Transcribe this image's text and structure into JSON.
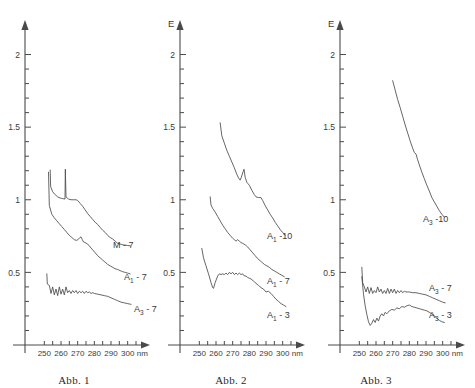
{
  "page": {
    "background": "#ffffff",
    "ink": "#4a4a4a",
    "text_color": "#3a3a3a"
  },
  "figures": [
    {
      "id": "fig1",
      "caption": "Abb. 1",
      "yaxis_label": "",
      "xaxis_unit": "nm",
      "yticks": [
        "0.5",
        "1.0",
        "1.5",
        "2.0"
      ],
      "xticks": [
        "250",
        "260",
        "270",
        "280",
        "290",
        "300"
      ],
      "curve_labels": [
        "M - 7",
        "A₁ - 7",
        "A₃ - 7"
      ]
    },
    {
      "id": "fig2",
      "caption": "Abb. 2",
      "yaxis_label": "E",
      "xaxis_unit": "nm",
      "yticks": [
        "0.5",
        "1.0",
        "1.5",
        "2.0"
      ],
      "xticks": [
        "250",
        "260",
        "270",
        "280",
        "290",
        "300"
      ],
      "curve_labels": [
        "A₁ -10",
        "A₁ - 7",
        "A₁ - 3"
      ]
    },
    {
      "id": "fig3",
      "caption": "Abb. 3",
      "yaxis_label": "E",
      "xaxis_unit": "nm",
      "yticks": [
        "0.5",
        "1.0",
        "1.5",
        "2.0"
      ],
      "xticks": [
        "250",
        "260",
        "270",
        "280",
        "290",
        "300"
      ],
      "curve_labels": [
        "A₃ -10",
        "A₃ - 7",
        "A₃ - 3"
      ]
    }
  ],
  "chart_data": [
    {
      "type": "line",
      "title": "Abb. 1",
      "xlabel": "nm",
      "ylabel": "E",
      "xlim": [
        245,
        308
      ],
      "ylim": [
        0,
        2.1
      ],
      "xticks": [
        250,
        260,
        270,
        280,
        290,
        300
      ],
      "yticks": [
        0.5,
        1.0,
        1.5,
        2.0
      ],
      "grid": false,
      "legend": "inline-right-of-curve",
      "series": [
        {
          "name": "M - 7",
          "x": [
            253.5,
            253.8,
            255,
            256.5,
            258,
            259.5,
            261,
            262.4,
            262.6,
            263,
            264.5,
            266,
            267.5,
            269,
            270,
            271.5,
            273,
            274.5,
            276,
            277.5,
            279,
            280.5,
            282,
            283.5,
            285,
            286.5,
            288,
            289.5,
            291,
            292.5,
            294,
            295.5,
            297,
            298.5,
            300,
            301.5
          ],
          "y": [
            1.205,
            1.09,
            1.055,
            1.035,
            1.02,
            1.012,
            1.008,
            1.005,
            1.21,
            1.02,
            1.005,
            1.0,
            1.0,
            1.0,
            0.995,
            0.975,
            0.955,
            0.93,
            0.905,
            0.885,
            0.865,
            0.845,
            0.83,
            0.81,
            0.79,
            0.775,
            0.755,
            0.74,
            0.73,
            0.715,
            0.7,
            0.695,
            0.69,
            0.688,
            0.685,
            0.683
          ]
        },
        {
          "name": "A₁ - 7",
          "x": [
            252.5,
            253,
            254.5,
            256,
            257.5,
            259,
            260.5,
            262,
            263.5,
            265,
            266.5,
            268,
            269.5,
            271,
            272,
            272.8,
            273.5,
            274.5,
            276,
            277.5,
            279,
            280.5,
            282,
            283.5,
            285,
            286.5,
            288,
            289.5,
            291,
            292.5,
            294,
            295.5,
            297,
            298.5,
            300,
            301.5
          ],
          "y": [
            1.19,
            0.96,
            0.9,
            0.875,
            0.855,
            0.835,
            0.815,
            0.795,
            0.775,
            0.755,
            0.74,
            0.725,
            0.72,
            0.735,
            0.745,
            0.725,
            0.71,
            0.705,
            0.695,
            0.675,
            0.655,
            0.635,
            0.615,
            0.6,
            0.585,
            0.57,
            0.555,
            0.545,
            0.535,
            0.525,
            0.52,
            0.512,
            0.505,
            0.5,
            0.495,
            0.49
          ]
        },
        {
          "name": "A₃ - 7",
          "x": [
            251.5,
            251.8,
            253,
            254,
            255,
            256,
            257,
            258,
            259,
            260,
            261,
            262,
            263,
            264,
            265,
            266,
            267,
            268,
            269,
            270,
            271,
            272,
            273,
            274,
            275,
            276,
            277,
            278,
            279,
            280,
            282,
            284,
            286,
            288,
            290,
            292,
            294,
            296,
            298,
            300,
            302
          ],
          "y": [
            0.49,
            0.42,
            0.41,
            0.355,
            0.4,
            0.345,
            0.385,
            0.34,
            0.4,
            0.35,
            0.385,
            0.345,
            0.4,
            0.36,
            0.375,
            0.355,
            0.375,
            0.36,
            0.375,
            0.355,
            0.37,
            0.36,
            0.37,
            0.355,
            0.37,
            0.36,
            0.365,
            0.355,
            0.36,
            0.355,
            0.35,
            0.345,
            0.34,
            0.335,
            0.325,
            0.315,
            0.305,
            0.295,
            0.29,
            0.285,
            0.28
          ]
        }
      ]
    },
    {
      "type": "line",
      "title": "Abb. 2",
      "xlabel": "nm",
      "ylabel": "E",
      "xlim": [
        245,
        308
      ],
      "ylim": [
        0,
        2.1
      ],
      "xticks": [
        250,
        260,
        270,
        280,
        290,
        300
      ],
      "yticks": [
        0.5,
        1.0,
        1.5,
        2.0
      ],
      "grid": false,
      "legend": "inline-right-of-curve",
      "series": [
        {
          "name": "A₁ -10",
          "x": [
            262.5,
            263.5,
            265,
            266.5,
            268,
            269.5,
            271,
            272.5,
            273.5,
            274.5,
            275.2,
            276,
            276.8,
            277.5,
            278.5,
            280,
            281.5,
            283,
            284,
            285.5,
            287,
            288,
            289.5,
            291,
            292.5,
            294,
            295.5,
            297,
            298.5,
            300,
            301.5
          ],
          "y": [
            1.53,
            1.44,
            1.39,
            1.34,
            1.3,
            1.26,
            1.22,
            1.175,
            1.15,
            1.135,
            1.155,
            1.185,
            1.21,
            1.155,
            1.12,
            1.1,
            1.065,
            1.035,
            1.02,
            1.015,
            1.015,
            0.995,
            0.96,
            0.93,
            0.9,
            0.875,
            0.845,
            0.82,
            0.795,
            0.775,
            0.755
          ]
        },
        {
          "name": "A₁ - 7",
          "x": [
            256.5,
            257,
            258,
            259.5,
            261,
            262.5,
            264,
            265.5,
            267,
            268.5,
            270,
            271,
            272,
            273,
            274,
            275,
            276,
            277.5,
            279,
            280.5,
            282,
            283.5,
            285,
            286.5,
            288,
            289,
            290.5,
            292,
            293.5,
            295,
            296.5,
            298,
            299.5,
            301
          ],
          "y": [
            1.02,
            0.965,
            0.94,
            0.915,
            0.885,
            0.855,
            0.825,
            0.8,
            0.775,
            0.755,
            0.735,
            0.725,
            0.715,
            0.725,
            0.715,
            0.705,
            0.7,
            0.69,
            0.675,
            0.655,
            0.635,
            0.615,
            0.595,
            0.58,
            0.565,
            0.555,
            0.545,
            0.535,
            0.52,
            0.51,
            0.5,
            0.49,
            0.48,
            0.47
          ]
        },
        {
          "name": "A₁ - 3",
          "x": [
            251.5,
            252.5,
            254,
            255.5,
            257,
            258,
            258.5,
            259.5,
            261,
            262,
            263,
            264,
            265,
            266,
            267,
            268,
            269,
            270,
            271,
            272,
            273,
            274,
            275,
            276,
            277,
            278,
            279,
            280,
            281,
            282.5,
            284,
            285.5,
            287,
            288.5,
            290,
            291.5,
            293,
            294.5,
            296,
            297.5,
            299,
            300.5,
            302
          ],
          "y": [
            0.665,
            0.6,
            0.545,
            0.49,
            0.43,
            0.395,
            0.39,
            0.43,
            0.475,
            0.49,
            0.485,
            0.49,
            0.485,
            0.495,
            0.485,
            0.5,
            0.49,
            0.5,
            0.485,
            0.495,
            0.485,
            0.495,
            0.485,
            0.49,
            0.475,
            0.475,
            0.465,
            0.46,
            0.455,
            0.44,
            0.425,
            0.41,
            0.395,
            0.385,
            0.365,
            0.37,
            0.355,
            0.335,
            0.315,
            0.3,
            0.285,
            0.275,
            0.265
          ]
        }
      ]
    },
    {
      "type": "line",
      "title": "Abb. 3",
      "xlabel": "nm",
      "ylabel": "E",
      "xlim": [
        245,
        308
      ],
      "ylim": [
        0,
        2.1
      ],
      "xticks": [
        250,
        260,
        270,
        280,
        290,
        300
      ],
      "yticks": [
        0.5,
        1.0,
        1.5,
        2.0
      ],
      "grid": false,
      "legend": "inline-right-of-curve",
      "series": [
        {
          "name": "A₃ -10",
          "x": [
            270,
            271.5,
            273,
            274.5,
            276,
            277.5,
            279,
            280.5,
            282,
            283,
            284,
            285,
            286,
            287.5,
            289,
            290.5,
            292,
            293.5,
            295,
            296.5,
            298,
            299.5,
            301
          ],
          "y": [
            1.82,
            1.755,
            1.69,
            1.635,
            1.575,
            1.515,
            1.46,
            1.405,
            1.355,
            1.325,
            1.315,
            1.275,
            1.24,
            1.19,
            1.145,
            1.1,
            1.06,
            1.015,
            0.985,
            0.955,
            0.925,
            0.9,
            0.88
          ]
        },
        {
          "name": "A₃ - 7",
          "x": [
            251.5,
            252,
            253,
            254,
            255,
            256,
            257,
            258,
            259,
            260,
            261,
            262,
            263,
            264,
            265,
            266,
            267,
            268,
            269,
            270,
            271,
            272,
            273,
            274,
            275,
            276,
            277,
            278,
            280,
            282,
            284,
            286,
            288,
            290,
            292,
            294,
            296,
            298,
            300,
            301.5
          ],
          "y": [
            0.535,
            0.43,
            0.4,
            0.365,
            0.4,
            0.355,
            0.395,
            0.355,
            0.375,
            0.36,
            0.4,
            0.365,
            0.385,
            0.355,
            0.375,
            0.355,
            0.39,
            0.355,
            0.385,
            0.36,
            0.385,
            0.355,
            0.375,
            0.36,
            0.375,
            0.36,
            0.37,
            0.365,
            0.365,
            0.36,
            0.36,
            0.355,
            0.35,
            0.345,
            0.335,
            0.325,
            0.315,
            0.305,
            0.295,
            0.29
          ]
        },
        {
          "name": "A₃ - 3",
          "x": [
            251.5,
            252.5,
            253.5,
            254.5,
            255.5,
            256.5,
            257.5,
            258.5,
            259.5,
            260.5,
            261.5,
            262.5,
            263.5,
            264.5,
            265.5,
            266.5,
            268,
            269.5,
            271,
            272.5,
            274,
            275.5,
            277,
            278.5,
            280,
            281.5,
            283,
            284.5,
            286,
            287.5,
            289,
            290.5,
            292,
            293.5,
            295,
            296.5,
            298,
            299.5,
            301
          ],
          "y": [
            0.47,
            0.35,
            0.27,
            0.21,
            0.16,
            0.135,
            0.15,
            0.175,
            0.155,
            0.185,
            0.165,
            0.2,
            0.215,
            0.2,
            0.225,
            0.215,
            0.235,
            0.245,
            0.24,
            0.255,
            0.25,
            0.265,
            0.26,
            0.27,
            0.275,
            0.265,
            0.26,
            0.255,
            0.25,
            0.245,
            0.24,
            0.235,
            0.225,
            0.215,
            0.2,
            0.185,
            0.17,
            0.16,
            0.155
          ]
        }
      ]
    }
  ]
}
